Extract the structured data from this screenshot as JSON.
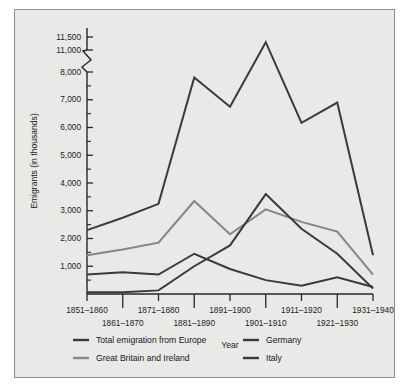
{
  "chart_data": {
    "type": "line",
    "title": "",
    "xlabel": "Year",
    "ylabel": "Emigrants (in thousands)",
    "categories": [
      "1851–1860",
      "1861–1870",
      "1871–1880",
      "1881–1890",
      "1891–1900",
      "1901–1910",
      "1911–1920",
      "1921–1930",
      "1931–1940"
    ],
    "ytick_labels": [
      "1,000",
      "2,000",
      "3,000",
      "4,000",
      "5,000",
      "6,000",
      "7,000",
      "8,000",
      "11,000",
      "11,500"
    ],
    "ytick_values": [
      1000,
      2000,
      3000,
      4000,
      5000,
      6000,
      7000,
      8000,
      11000,
      11500
    ],
    "ylim": [
      0,
      11500
    ],
    "axis_break": {
      "present": true,
      "below": 8000,
      "above": 11000
    },
    "grid": false,
    "legend_position": "bottom",
    "series": [
      {
        "name": "Total emigration from Europe",
        "color": "#3a3a3e",
        "values": [
          2300,
          2750,
          3250,
          7800,
          6750,
          11300,
          8200,
          6900,
          1400
        ]
      },
      {
        "name": "Great Britain and Ireland",
        "color": "#84848a",
        "values": [
          1400,
          1600,
          1850,
          3350,
          2150,
          3050,
          2600,
          2250,
          700
        ]
      },
      {
        "name": "Germany",
        "color": "#3a3a3e",
        "values": [
          700,
          780,
          700,
          1450,
          900,
          500,
          300,
          600,
          250
        ]
      },
      {
        "name": "Italy",
        "color": "#3a3a3e",
        "values": [
          60,
          60,
          130,
          1000,
          1750,
          3600,
          2350,
          1450,
          200
        ]
      }
    ]
  },
  "legend": {
    "entries": [
      {
        "label": "Total emigration from Europe"
      },
      {
        "label": "Germany"
      },
      {
        "label": "Great Britain and Ireland"
      },
      {
        "label": "Italy"
      }
    ]
  }
}
